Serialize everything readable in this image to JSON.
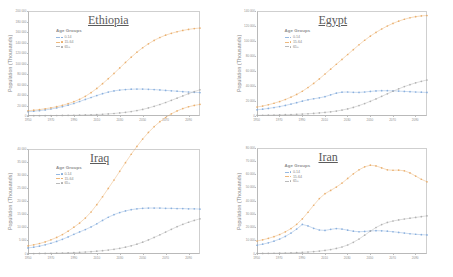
{
  "figure": {
    "layout": "2x2 grid of line charts",
    "series_colors": {
      "0-14": "#7da7d9",
      "15-64": "#e8a75e",
      "65+": "#a9a9a9"
    },
    "legend_title": "Age Groups",
    "ylabel": "Population (Thousands)"
  },
  "chart_data": [
    {
      "type": "line",
      "title": "Ethiopia",
      "xlabel": "",
      "ylabel": "Population (Thousands)",
      "legend_title": "Age Groups",
      "legend_position": "upper left",
      "grid": false,
      "xlim": [
        1950,
        2100
      ],
      "ylim": [
        0,
        200000
      ],
      "xticks": [
        1950,
        1970,
        1990,
        2010,
        2030,
        2050,
        2070,
        2090
      ],
      "yticks": [
        0,
        20000,
        40000,
        60000,
        80000,
        100000,
        120000,
        140000,
        160000,
        180000,
        200000
      ],
      "ytick_labels": [
        "0",
        "20 000",
        "40 000",
        "60 000",
        "80 000",
        "100 000",
        "120 000",
        "140 000",
        "160 000",
        "180 000",
        "200 000"
      ],
      "x": [
        1950,
        1955,
        1960,
        1965,
        1970,
        1975,
        1980,
        1985,
        1990,
        1995,
        2000,
        2005,
        2010,
        2015,
        2020,
        2025,
        2030,
        2035,
        2040,
        2045,
        2050,
        2055,
        2060,
        2065,
        2070,
        2075,
        2080,
        2085,
        2090,
        2095,
        2100
      ],
      "series": [
        {
          "name": "0-14",
          "color": "#7da7d9",
          "values": [
            8200,
            9100,
            10200,
            11600,
            13300,
            15400,
            17800,
            20600,
            23800,
            27600,
            31500,
            35200,
            39000,
            42500,
            45500,
            47800,
            49400,
            50400,
            51000,
            51300,
            51200,
            50900,
            50300,
            49600,
            48800,
            48000,
            47200,
            46400,
            45700,
            45100,
            44600
          ]
        },
        {
          "name": "15-64",
          "color": "#e8a75e",
          "values": [
            10000,
            11000,
            12300,
            13800,
            15600,
            17800,
            20400,
            23500,
            27200,
            31800,
            37500,
            44500,
            52500,
            61500,
            71000,
            81000,
            91500,
            102000,
            112000,
            121500,
            130000,
            137500,
            144000,
            149500,
            154000,
            157500,
            160500,
            163000,
            165000,
            166500,
            167500
          ]
        },
        {
          "name": "65+",
          "color": "#a9a9a9",
          "values": [
            500,
            560,
            630,
            710,
            810,
            930,
            1070,
            1240,
            1450,
            1700,
            2000,
            2350,
            2800,
            3350,
            4000,
            4800,
            5800,
            7000,
            8500,
            10400,
            12600,
            15300,
            18400,
            21900,
            25700,
            29800,
            34000,
            38300,
            42500,
            46500,
            50000
          ]
        }
      ]
    },
    {
      "type": "line",
      "title": "Egypt",
      "xlabel": "",
      "ylabel": "Population (Thousands)",
      "legend_title": "Age Groups",
      "legend_position": "upper left",
      "grid": false,
      "xlim": [
        1950,
        2100
      ],
      "ylim": [
        0,
        140000
      ],
      "xticks": [
        1950,
        1970,
        1990,
        2010,
        2030,
        2050,
        2070,
        2090
      ],
      "yticks": [
        0,
        20000,
        40000,
        60000,
        80000,
        100000,
        120000,
        140000
      ],
      "ytick_labels": [
        "0",
        "20 000",
        "40 000",
        "60 000",
        "80 000",
        "100 000",
        "120 000",
        "140 000"
      ],
      "x": [
        1950,
        1955,
        1960,
        1965,
        1970,
        1975,
        1980,
        1985,
        1990,
        1995,
        2000,
        2005,
        2010,
        2015,
        2020,
        2025,
        2030,
        2035,
        2040,
        2045,
        2050,
        2055,
        2060,
        2065,
        2070,
        2075,
        2080,
        2085,
        2090,
        2095,
        2100
      ],
      "series": [
        {
          "name": "0-14",
          "color": "#7da7d9",
          "values": [
            8300,
            9100,
            10100,
            11300,
            12600,
            14100,
            15900,
            17800,
            19800,
            21600,
            23000,
            24200,
            25800,
            28200,
            30500,
            31800,
            32000,
            31600,
            31500,
            32000,
            32800,
            33400,
            33700,
            33700,
            33500,
            33200,
            32800,
            32400,
            32000,
            31700,
            31400
          ]
        },
        {
          "name": "15-64",
          "color": "#e8a75e",
          "values": [
            12000,
            13300,
            15000,
            17000,
            19300,
            22000,
            25200,
            28800,
            33000,
            38000,
            43500,
            49500,
            56000,
            62500,
            69000,
            75500,
            82000,
            88500,
            95000,
            101000,
            106500,
            111500,
            116000,
            120000,
            123500,
            126500,
            129000,
            131000,
            132500,
            133500,
            134000
          ]
        },
        {
          "name": "65+",
          "color": "#a9a9a9",
          "values": [
            900,
            1000,
            1150,
            1300,
            1500,
            1700,
            1950,
            2250,
            2600,
            3000,
            3500,
            4100,
            4800,
            5600,
            6600,
            7900,
            9500,
            11500,
            13900,
            16600,
            19600,
            22800,
            26200,
            29600,
            33000,
            36200,
            39200,
            41800,
            44200,
            46200,
            48000
          ]
        }
      ]
    },
    {
      "type": "line",
      "title": "Iraq",
      "xlabel": "",
      "ylabel": "Population (Thousands)",
      "legend_title": "Age Groups",
      "legend_position": "upper left",
      "grid": false,
      "xlim": [
        1950,
        2100
      ],
      "ylim": [
        0,
        40000
      ],
      "xticks": [
        1950,
        1970,
        1990,
        2010,
        2030,
        2050,
        2070,
        2090
      ],
      "yticks": [
        0,
        5000,
        10000,
        15000,
        20000,
        25000,
        30000,
        35000,
        40000
      ],
      "ytick_labels": [
        "0",
        "5 000",
        "10 000",
        "15 000",
        "20 000",
        "25 000",
        "30 000",
        "35 000",
        "40 000"
      ],
      "x": [
        1950,
        1955,
        1960,
        1965,
        1970,
        1975,
        1980,
        1985,
        1990,
        1995,
        2000,
        2005,
        2010,
        2015,
        2020,
        2025,
        2030,
        2035,
        2040,
        2045,
        2050,
        2055,
        2060,
        2065,
        2070,
        2075,
        2080,
        2085,
        2090,
        2095,
        2100
      ],
      "series": [
        {
          "name": "0-14",
          "color": "#7da7d9",
          "values": [
            2300,
            2600,
            3000,
            3500,
            4100,
            4800,
            5600,
            6500,
            7500,
            8400,
            9300,
            10300,
            11500,
            12800,
            14000,
            15000,
            15800,
            16400,
            16900,
            17200,
            17400,
            17500,
            17500,
            17500,
            17400,
            17400,
            17300,
            17300,
            17200,
            17200,
            17100
          ]
        },
        {
          "name": "15-64",
          "color": "#e8a75e",
          "values": [
            3100,
            3500,
            4000,
            4600,
            5400,
            6300,
            7400,
            8700,
            10200,
            11800,
            13700,
            16000,
            18800,
            21800,
            25000,
            28200,
            31500,
            34800,
            38000,
            41000,
            43800,
            46300,
            48500,
            50400,
            52000,
            53400,
            54500,
            55400,
            56100,
            56600,
            57000
          ]
        },
        {
          "name": "65+",
          "color": "#a9a9a9",
          "values": [
            150,
            170,
            200,
            230,
            270,
            320,
            380,
            450,
            540,
            640,
            760,
            900,
            1070,
            1270,
            1510,
            1800,
            2160,
            2600,
            3130,
            3760,
            4500,
            5350,
            6300,
            7300,
            8350,
            9400,
            10400,
            11300,
            12100,
            12800,
            13400
          ]
        }
      ]
    },
    {
      "type": "line",
      "title": "Iran",
      "xlabel": "",
      "ylabel": "Population (Thousands)",
      "legend_title": "Age Groups",
      "legend_position": "upper left",
      "grid": false,
      "xlim": [
        1950,
        2100
      ],
      "ylim": [
        0,
        80000
      ],
      "xticks": [
        1950,
        1970,
        1990,
        2010,
        2030,
        2050,
        2070,
        2090
      ],
      "yticks": [
        0,
        10000,
        20000,
        30000,
        40000,
        50000,
        60000,
        70000,
        80000
      ],
      "ytick_labels": [
        "0",
        "10 000",
        "20 000",
        "30 000",
        "40 000",
        "50 000",
        "60 000",
        "70 000",
        "80 000"
      ],
      "x": [
        1950,
        1955,
        1960,
        1965,
        1970,
        1975,
        1980,
        1985,
        1990,
        1995,
        2000,
        2005,
        2010,
        2015,
        2020,
        2025,
        2030,
        2035,
        2040,
        2045,
        2050,
        2055,
        2060,
        2065,
        2070,
        2075,
        2080,
        2085,
        2090,
        2095,
        2100
      ],
      "series": [
        {
          "name": "0-14",
          "color": "#7da7d9",
          "values": [
            6600,
            7400,
            8400,
            9700,
            11300,
            13300,
            15800,
            18800,
            22300,
            21200,
            19400,
            18100,
            17800,
            18600,
            19200,
            18800,
            18000,
            17200,
            16800,
            17000,
            17400,
            17600,
            17500,
            17200,
            16800,
            16300,
            15800,
            15300,
            14900,
            14600,
            14400
          ]
        },
        {
          "name": "15-64",
          "color": "#e8a75e",
          "values": [
            9800,
            10700,
            11800,
            13100,
            14700,
            16700,
            19200,
            22400,
            26500,
            31500,
            36800,
            41800,
            45500,
            48000,
            50500,
            53500,
            57000,
            60500,
            63500,
            65800,
            67000,
            66500,
            65000,
            63500,
            63200,
            63300,
            62800,
            61200,
            58800,
            56400,
            54500
          ]
        },
        {
          "name": "65+",
          "color": "#a9a9a9",
          "values": [
            400,
            450,
            510,
            580,
            670,
            770,
            900,
            1060,
            1260,
            1500,
            1800,
            2200,
            2700,
            3350,
            4200,
            5300,
            6800,
            8800,
            11300,
            14200,
            17200,
            20000,
            22200,
            23800,
            24900,
            25700,
            26400,
            27000,
            27600,
            28200,
            28800
          ]
        }
      ]
    }
  ]
}
